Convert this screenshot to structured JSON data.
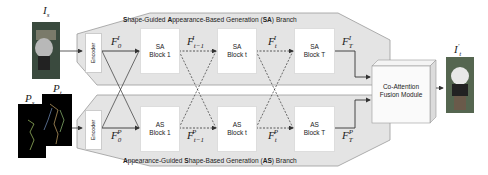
{
  "diagram": {
    "inputs": {
      "source_image_label": "I_s",
      "source_pose_label": "P_s",
      "target_pose_label": "P_t"
    },
    "output": {
      "label": "I'_t"
    },
    "sa_branch": {
      "title_parts": [
        {
          "text": "S",
          "bold": true
        },
        {
          "text": "hape-Guided ",
          "bold": false
        },
        {
          "text": "A",
          "bold": true
        },
        {
          "text": "ppearance-Based Generation (",
          "bold": false
        },
        {
          "text": "SA",
          "bold": true
        },
        {
          "text": ") Branch",
          "bold": false
        }
      ],
      "encoder": "Encoder",
      "blocks": [
        {
          "line1": "SA",
          "line2": "Block 1"
        },
        {
          "line1": "SA",
          "line2": "Block t"
        },
        {
          "line1": "SA",
          "line2": "Block T"
        }
      ],
      "features": [
        "F_0^I",
        "F_{t-1}^I",
        "F_t^I",
        "F_T^I"
      ]
    },
    "as_branch": {
      "title_parts": [
        {
          "text": "A",
          "bold": true
        },
        {
          "text": "ppearance-Guided ",
          "bold": false
        },
        {
          "text": "S",
          "bold": true
        },
        {
          "text": "hape-Based Generation (",
          "bold": false
        },
        {
          "text": "AS",
          "bold": true
        },
        {
          "text": ") Branch",
          "bold": false
        }
      ],
      "encoder": "Encoder",
      "blocks": [
        {
          "line1": "AS",
          "line2": "Block 1"
        },
        {
          "line1": "AS",
          "line2": "Block t"
        },
        {
          "line1": "AS",
          "line2": "Block T"
        }
      ],
      "features": [
        "F_0^P",
        "F_{t-1}^P",
        "F_t^P",
        "F_T^P"
      ]
    },
    "fusion": {
      "line1": "Co-Attention",
      "line2": "Fusion Module"
    },
    "colors": {
      "branch_fill": "#e4e4e4",
      "branch_stroke": "#9a9a9a",
      "arrow": "#333333",
      "block_fill": "#ffffff"
    }
  }
}
